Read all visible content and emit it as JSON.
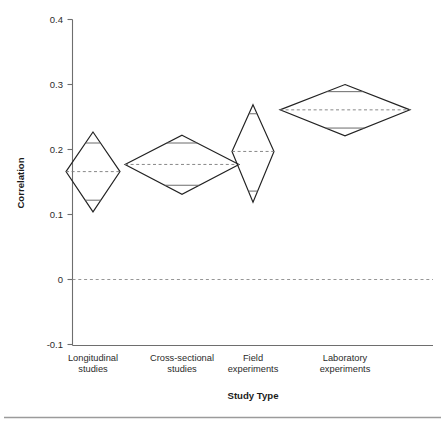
{
  "chart_data": {
    "type": "scatter",
    "subtype": "diamond-means-plot",
    "title": "",
    "xlabel": "Study Type",
    "ylabel": "Correlation",
    "categories": [
      "Longitudinal studies",
      "Cross-sectional studies",
      "Field experiments",
      "Laboratory experiments"
    ],
    "category_lines": [
      [
        "Longitudinal",
        "studies"
      ],
      [
        "Cross-sectional",
        "studies"
      ],
      [
        "Field",
        "experiments"
      ],
      [
        "Laboratory",
        "experiments"
      ]
    ],
    "ylim": [
      -0.1,
      0.4
    ],
    "y_ticks": [
      -0.1,
      0,
      0.1,
      0.2,
      0.3,
      0.4
    ],
    "y_tick_labels": [
      "-0.1",
      "0",
      "0.1",
      "0.2",
      "0.3",
      "0.4"
    ],
    "grid": false,
    "legend": null,
    "reference_line": 0,
    "series": [
      {
        "name": "Longitudinal studies",
        "mean": 0.166,
        "ci_upper": 0.227,
        "ci_lower": 0.104,
        "overlap_upper": 0.21,
        "overlap_lower": 0.122,
        "half_width_px": 27
      },
      {
        "name": "Cross-sectional studies",
        "mean": 0.177,
        "ci_upper": 0.222,
        "ci_lower": 0.131,
        "overlap_upper": 0.21,
        "overlap_lower": 0.145,
        "half_width_px": 57
      },
      {
        "name": "Field experiments",
        "mean": 0.197,
        "ci_upper": 0.269,
        "ci_lower": 0.119,
        "overlap_upper": 0.255,
        "overlap_lower": 0.136,
        "half_width_px": 21
      },
      {
        "name": "Laboratory experiments",
        "mean": 0.261,
        "ci_upper": 0.3,
        "ci_lower": 0.221,
        "overlap_upper": 0.289,
        "overlap_lower": 0.233,
        "half_width_px": 65
      }
    ],
    "centers_px": [
      93,
      182,
      253,
      345
    ],
    "colors": {
      "diamond_stroke": "#222222",
      "mean_line": "#7a7a7a",
      "ci_line": "#5a5a5a",
      "axis": "#6e6e6e",
      "text": "#2b2b2b",
      "background": "#ffffff"
    }
  },
  "axis": {
    "y_title": "Correlation",
    "x_title": "Study Type",
    "y_labels": {
      "t0": "0.4",
      "t1": "0.3",
      "t2": "0.2",
      "t3": "0.1",
      "t4": "0",
      "t5": "-0.1"
    }
  },
  "x_labels": {
    "c0_l1": "Longitudinal",
    "c0_l2": "studies",
    "c1_l1": "Cross-sectional",
    "c1_l2": "studies",
    "c2_l1": "Field",
    "c2_l2": "experiments",
    "c3_l1": "Laboratory",
    "c3_l2": "experiments"
  }
}
